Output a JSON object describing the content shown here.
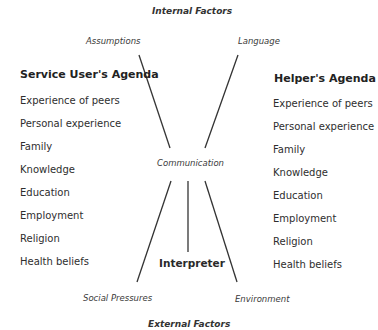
{
  "top_heading": "Internal Factors",
  "bottom_heading": "External Factors",
  "factors": {
    "top_left": "Assumptions",
    "top_right": "Language",
    "bottom_left": "Social Pressures",
    "bottom_right": "Environment"
  },
  "center": {
    "communication": "Communication",
    "interpreter": "Interpreter"
  },
  "left_agenda": {
    "title": "Service User's Agenda",
    "items": [
      "Experience of peers",
      "Personal experience",
      "Family",
      "Knowledge",
      "Education",
      "Employment",
      "Religion",
      "Health beliefs"
    ]
  },
  "right_agenda": {
    "title": "Helper's Agenda",
    "items": [
      "Experience of peers",
      "Personal experience",
      "Family",
      "Knowledge",
      "Education",
      "Employment",
      "Religion",
      "Health beliefs"
    ]
  },
  "colors": {
    "line": "#333333",
    "text": "#2a2a2a"
  }
}
